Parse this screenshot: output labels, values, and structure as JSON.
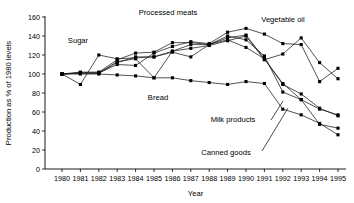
{
  "chart_data": {
    "type": "line",
    "title": "",
    "xlabel": "Year",
    "ylabel": "Production as % of 1980 levels",
    "xlim": [
      1980,
      1995
    ],
    "ylim": [
      0,
      160
    ],
    "ytick_step": 20,
    "grid": false,
    "legend": "annotations-inline",
    "x": [
      1980,
      1981,
      1982,
      1983,
      1984,
      1985,
      1986,
      1987,
      1988,
      1989,
      1990,
      1991,
      1992,
      1993,
      1994,
      1995
    ],
    "xticks": [
      "1980",
      "1981",
      "1982",
      "1983",
      "1984",
      "1985",
      "1986",
      "1987",
      "1988",
      "1989",
      "1990",
      "1991",
      "1992",
      "1993",
      "1994",
      "1995"
    ],
    "yticks": [
      "0",
      "20",
      "40",
      "60",
      "80",
      "100",
      "120",
      "140",
      "160"
    ],
    "series": [
      {
        "name": "Sugar",
        "values": [
          100,
          89,
          120,
          116,
          117,
          118,
          123,
          118,
          131,
          140,
          136,
          119,
          81,
          73,
          47,
          43
        ]
      },
      {
        "name": "Processed meats",
        "values": [
          100,
          101,
          101,
          110,
          109,
          122,
          129,
          134,
          132,
          144,
          148,
          142,
          132,
          131,
          92,
          106
        ]
      },
      {
        "name": "Bread",
        "values": [
          100,
          100,
          100,
          99,
          98,
          96,
          96,
          93,
          91,
          89,
          92,
          90,
          63,
          57,
          48,
          36
        ]
      },
      {
        "name": "Vegetable oil",
        "values": [
          100,
          101,
          101,
          113,
          116,
          96,
          124,
          127,
          130,
          135,
          140,
          115,
          121,
          138,
          112,
          95
        ]
      },
      {
        "name": "Milk products",
        "values": [
          100,
          102,
          102,
          115,
          122,
          123,
          133,
          133,
          131,
          138,
          141,
          116,
          89,
          79,
          64,
          56
        ]
      },
      {
        "name": "Canned goods",
        "values": [
          100,
          101,
          101,
          112,
          118,
          118,
          124,
          131,
          131,
          136,
          128,
          116,
          90,
          73,
          63,
          57
        ]
      }
    ],
    "annotations": [
      {
        "label": "Sugar",
        "x": 78,
        "y": 43
      },
      {
        "label": "Processed meats",
        "x": 168,
        "y": 15
      },
      {
        "label": "Vegetable oil",
        "x": 283,
        "y": 22
      },
      {
        "label": "Bread",
        "x": 158,
        "y": 100
      },
      {
        "label": "Milk products",
        "x": 233,
        "y": 122
      },
      {
        "label": "Canned goods",
        "x": 226,
        "y": 155
      }
    ]
  }
}
